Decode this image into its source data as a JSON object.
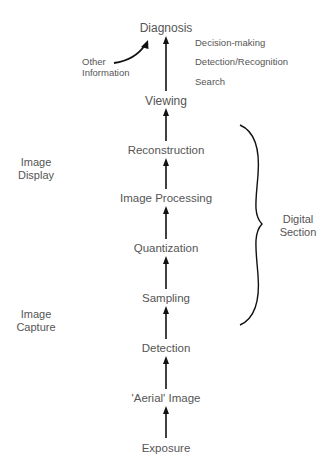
{
  "diagram": {
    "type": "flowchart",
    "direction": "bottom-to-top",
    "stages": [
      {
        "id": "exposure",
        "label": "Exposure"
      },
      {
        "id": "aerial-image",
        "label": "'Aerial' Image"
      },
      {
        "id": "detection",
        "label": "Detection"
      },
      {
        "id": "sampling",
        "label": "Sampling"
      },
      {
        "id": "quantization",
        "label": "Quantization"
      },
      {
        "id": "image-processing",
        "label": "Image Processing"
      },
      {
        "id": "reconstruction",
        "label": "Reconstruction"
      },
      {
        "id": "viewing",
        "label": "Viewing"
      },
      {
        "id": "diagnosis",
        "label": "Diagnosis"
      }
    ],
    "diagnosis_subtasks": [
      "Decision-making",
      "Detection/Recognition",
      "Search"
    ],
    "other_input": {
      "line1": "Other",
      "line2": "Information"
    },
    "groups": {
      "image_display": {
        "line1": "Image",
        "line2": "Display"
      },
      "image_capture": {
        "line1": "Image",
        "line2": "Capture"
      },
      "digital_section": {
        "line1": "Digital",
        "line2": "Section"
      }
    },
    "colors": {
      "text": "#555555",
      "arrow": "#111111",
      "background": "#ffffff"
    }
  }
}
